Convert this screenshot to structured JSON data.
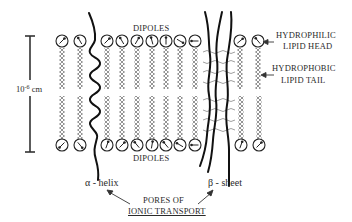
{
  "figure": {
    "type": "lipid bilayer membrane diagram",
    "labels": {
      "dipoles_top": "DIPOLES",
      "dipoles_bottom": "DIPOLES",
      "hydrophilic_line1": "HYDROPHILIC",
      "hydrophilic_line2": "LIPID HEAD",
      "hydrophobic_line1": "HYDROPHOBIC",
      "hydrophobic_line2": "LIPID TAIL",
      "scale_base": "10",
      "scale_exp": "-6",
      "scale_unit": " cm",
      "alpha_helix": "α - helix",
      "beta_sheet": "β - sheet",
      "pores_line1": "PORES OF",
      "pores_line2": "IONIC TRANSPORT"
    },
    "top_heads": [
      {
        "x": 62,
        "angle": 45
      },
      {
        "x": 80,
        "angle": -30
      },
      {
        "x": 107,
        "angle": 45
      },
      {
        "x": 122,
        "angle": -30
      },
      {
        "x": 137,
        "angle": 30
      },
      {
        "x": 152,
        "angle": -15
      },
      {
        "x": 166,
        "angle": 0
      },
      {
        "x": 180,
        "angle": 120
      },
      {
        "x": 195,
        "angle": -90
      },
      {
        "x": 240,
        "angle": 50
      },
      {
        "x": 258,
        "angle": -40
      }
    ],
    "bottom_heads": [
      {
        "x": 62,
        "angle": 225
      },
      {
        "x": 80,
        "angle": 140
      },
      {
        "x": 107,
        "angle": 20
      },
      {
        "x": 122,
        "angle": 45
      },
      {
        "x": 137,
        "angle": -40
      },
      {
        "x": 152,
        "angle": 10
      },
      {
        "x": 166,
        "angle": -40
      },
      {
        "x": 180,
        "angle": -60
      },
      {
        "x": 195,
        "angle": -90
      },
      {
        "x": 241,
        "angle": 20
      },
      {
        "x": 259,
        "angle": 45
      }
    ],
    "colors": {
      "ink": "#1a1a1a",
      "tail": "#555555",
      "text": "#2a2a2a"
    }
  }
}
